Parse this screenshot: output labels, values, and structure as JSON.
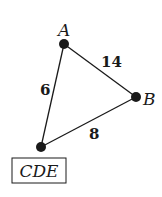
{
  "diagram": {
    "type": "weighted-graph",
    "nodes": [
      {
        "id": "A",
        "label": "A",
        "x": 64,
        "y": 44,
        "boxed": false
      },
      {
        "id": "B",
        "label": "B",
        "x": 136,
        "y": 97,
        "boxed": false
      },
      {
        "id": "CDE",
        "label": "CDE",
        "x": 41,
        "y": 147,
        "boxed": true
      }
    ],
    "edges": [
      {
        "from": "A",
        "to": "B",
        "weight": "14"
      },
      {
        "from": "A",
        "to": "CDE",
        "weight": "6"
      },
      {
        "from": "B",
        "to": "CDE",
        "weight": "8"
      }
    ],
    "colors": {
      "ink": "#1a1a1a",
      "background": "#ffffff"
    }
  }
}
